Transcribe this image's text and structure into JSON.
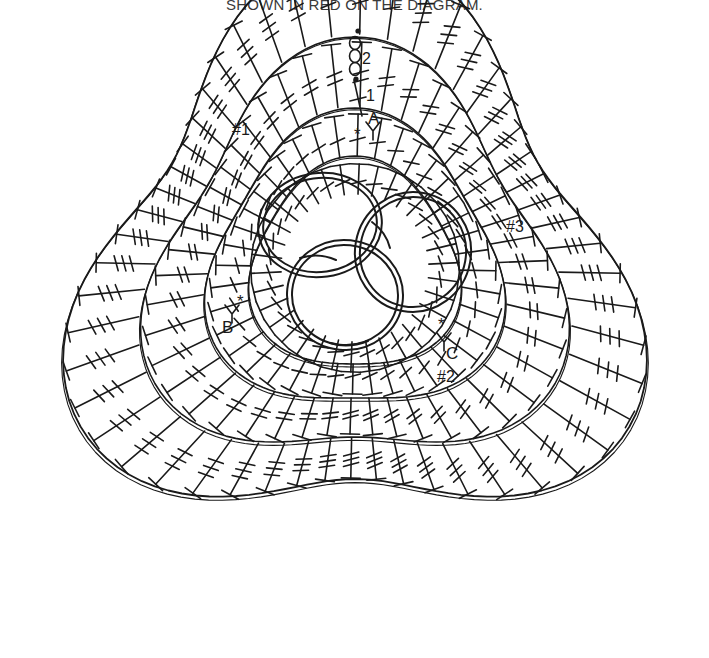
{
  "header": {
    "note_text": "SHOWN IN RED ON THE DIAGRAM."
  },
  "diagram": {
    "ink_color": "#1a1a1a",
    "background_color": "#ffffff",
    "labels": {
      "start_chain_count": "2",
      "first_stitch_number": "1",
      "marker_a": "A",
      "marker_b": "B",
      "marker_c": "C",
      "round_one": "#1",
      "round_two": "#2",
      "round_three": "#3",
      "repeat_star_a": "*",
      "repeat_star_b": "*",
      "repeat_star_c": "*"
    },
    "symbols": {
      "chain_stitch": "chain-loop",
      "slip_stitch": "dot",
      "double_crochet": "stem-one-bar",
      "treble_crochet": "stem-two-bar",
      "double_treble_crochet": "stem-three-bar",
      "ring": "oval-loop-ring"
    },
    "structure": {
      "shape": "triangle",
      "center_rings": 3,
      "rounds": 3,
      "corner_count": 3
    }
  }
}
